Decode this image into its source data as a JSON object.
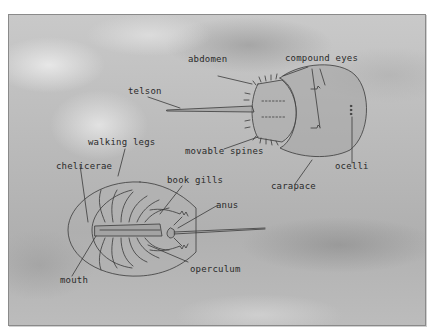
{
  "diagram": {
    "views": [
      "dorsal",
      "ventral"
    ],
    "labels": {
      "abdomen": "abdomen",
      "compound_eyes": "compound eyes",
      "telson": "telson",
      "movable_spines": "movable spines",
      "ocelli": "ocelli",
      "carapace": "carapace",
      "walking_legs": "walking legs",
      "chelicerae": "chelicerae",
      "book_gills": "book gills",
      "anus": "anus",
      "operculum": "operculum",
      "mouth": "mouth"
    }
  }
}
